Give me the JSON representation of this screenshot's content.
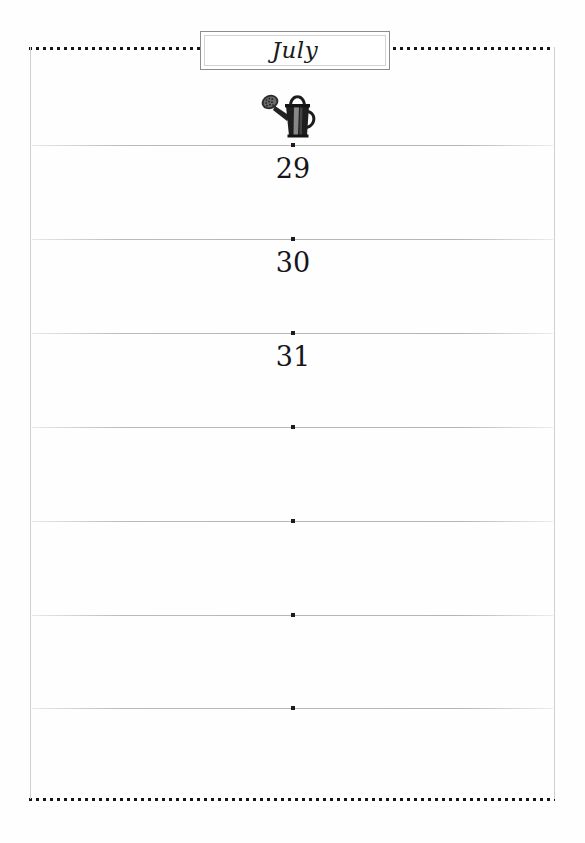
{
  "page": {
    "month_title": "July",
    "illustration": "watering-can-engraving",
    "background_color": "#fefefe",
    "border_dot_color": "#161616",
    "rule_line_color": "#b4b4b4",
    "ink_color": "#15151a"
  },
  "title_plate": {
    "label": "July"
  },
  "rules": [
    {
      "y": 145,
      "day": "29",
      "day_y": 155
    },
    {
      "y": 239,
      "day": "30",
      "day_y": 249
    },
    {
      "y": 333,
      "day": "31",
      "day_y": 343
    },
    {
      "y": 427,
      "day": "",
      "day_y": 437
    },
    {
      "y": 521,
      "day": "",
      "day_y": 531
    },
    {
      "y": 615,
      "day": "",
      "day_y": 625
    },
    {
      "y": 708,
      "day": "",
      "day_y": 718
    }
  ],
  "days": [
    {
      "number": "29"
    },
    {
      "number": "30"
    },
    {
      "number": "31"
    }
  ]
}
